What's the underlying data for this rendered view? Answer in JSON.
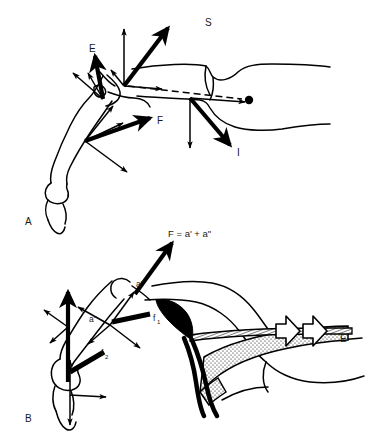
{
  "figure": {
    "background_color": "#ffffff",
    "ink_color": "#000000",
    "text_color": "#1a1a1a",
    "width": 371,
    "height": 441
  },
  "panels": [
    {
      "id": "A",
      "letter": "A",
      "letter_x": 25,
      "letter_y": 225,
      "description": "Skeleton limb at joint with resolved force vectors",
      "labels": [
        {
          "name": "vector-label-S",
          "text": "S",
          "x": 205,
          "y": 26
        },
        {
          "name": "vector-label-E",
          "text": "E",
          "x": 89,
          "y": 52
        },
        {
          "name": "vector-label-F",
          "text": "F",
          "x": 157,
          "y": 124
        },
        {
          "name": "vector-label-I",
          "text": "I",
          "x": 237,
          "y": 156
        }
      ]
    },
    {
      "id": "B",
      "letter": "B",
      "letter_x": 25,
      "letter_y": 422,
      "description": "Same limb with muscle belly, tendon and component force vectors",
      "equation": {
        "name": "equation-F",
        "text": "F = a' + a\"",
        "x": 168,
        "y": 237
      },
      "labels": [
        {
          "name": "vector-label-a-prime",
          "text": "a'",
          "x": 136,
          "y": 287
        },
        {
          "name": "vector-label-a-double-prime",
          "text": "a\"",
          "x": 89,
          "y": 322
        },
        {
          "name": "vector-label-f1",
          "text": "f",
          "sub": "1",
          "x": 153,
          "y": 321
        },
        {
          "name": "vector-label-f2",
          "text": "f",
          "sub": "2",
          "x": 101,
          "y": 356
        },
        {
          "name": "vector-label-E",
          "text": "E",
          "x": 340,
          "y": 342
        }
      ]
    }
  ],
  "legend": {
    "S": "superior / compressive joint reaction component",
    "E": "extension force vector",
    "F": "resultant muscle force",
    "I": "inferior / shear joint reaction component",
    "a_prime": "force component a'",
    "a_double_prime": "force component a\"",
    "f1": "component force f1",
    "f2": "component force f2"
  }
}
